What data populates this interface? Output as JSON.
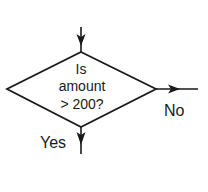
{
  "diagram": {
    "type": "flowchart-decision",
    "decision": {
      "shape": "diamond",
      "lines": [
        "Is",
        "amount",
        "> 200?"
      ]
    },
    "branches": {
      "no": {
        "label": "No",
        "direction": "right"
      },
      "yes": {
        "label": "Yes",
        "direction": "down"
      }
    },
    "input": {
      "direction": "from-top"
    },
    "colors": {
      "stroke": "#1a1a1a",
      "background": "#ffffff",
      "text": "#1a1a1a"
    }
  }
}
